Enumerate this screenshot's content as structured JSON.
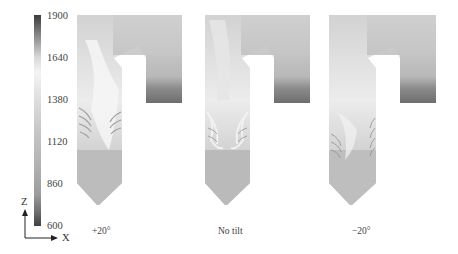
{
  "figure": {
    "colorbar": {
      "ticks": [
        "1900",
        "1640",
        "1380",
        "1120",
        "860",
        "600"
      ],
      "min": 600,
      "max": 1900,
      "colormap": [
        "#3b3b3b",
        "#f4f4f4",
        "#b4b4b4",
        "#404040"
      ]
    },
    "axes": {
      "vertical_label": "Z",
      "horizontal_label": "X"
    },
    "panels": [
      {
        "label": "+20°"
      },
      {
        "label": "No tilt"
      },
      {
        "label": "−20°"
      }
    ]
  }
}
